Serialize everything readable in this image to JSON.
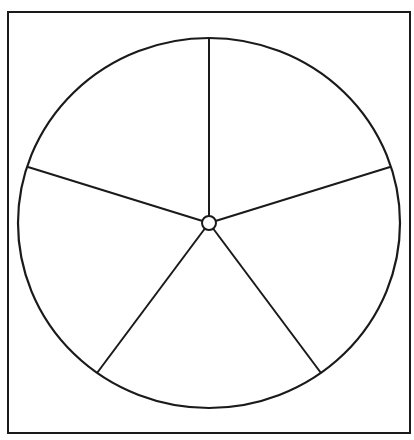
{
  "diagram": {
    "type": "spinner-wheel",
    "sections": 5,
    "colors": {
      "background": "#ffffff",
      "stroke": "#1a1a1a"
    },
    "frame": {
      "x": 8,
      "y": 12,
      "width": 402,
      "height": 421,
      "stroke_width": 2
    },
    "wheel": {
      "cx": 209,
      "cy": 223,
      "rx": 191,
      "ry": 185,
      "stroke_width": 2.2
    },
    "hub": {
      "r": 7,
      "stroke_width": 2
    },
    "spokes": [
      {
        "x": 209,
        "y": 38
      },
      {
        "x": 390,
        "y": 167
      },
      {
        "x": 321,
        "y": 373
      },
      {
        "x": 97,
        "y": 373
      },
      {
        "x": 28,
        "y": 167
      }
    ]
  }
}
